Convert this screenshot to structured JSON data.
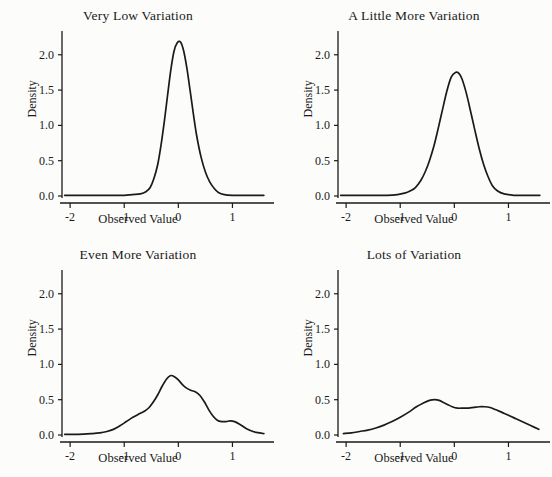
{
  "figure": {
    "background_color": "#fcfcfb",
    "line_color": "#1a1a1a",
    "axis_color": "#1a1a1a",
    "panel_rows": 2,
    "panel_cols": 2
  },
  "chart_data": [
    {
      "type": "line",
      "title": "Very Low Variation",
      "xlabel": "Observed Value",
      "ylabel": "Density",
      "xlim": [
        -2.15,
        1.62
      ],
      "ylim": [
        0.0,
        2.28
      ],
      "xticks": [
        -2,
        -1,
        0,
        1
      ],
      "xticklabels": [
        "-2",
        "-1",
        "0",
        "1"
      ],
      "yticks": [
        0.0,
        0.5,
        1.0,
        1.5,
        2.0
      ],
      "yticklabels": [
        "0.0",
        "0.5",
        "1.0",
        "1.5",
        "2.0"
      ],
      "grid": false,
      "legend": "none",
      "x": [
        -2.1,
        -1.8,
        -1.5,
        -1.2,
        -1.0,
        -0.85,
        -0.7,
        -0.6,
        -0.52,
        -0.45,
        -0.38,
        -0.32,
        -0.26,
        -0.2,
        -0.14,
        -0.08,
        -0.02,
        0.04,
        0.1,
        0.16,
        0.22,
        0.28,
        0.34,
        0.42,
        0.5,
        0.58,
        0.66,
        0.74,
        0.85,
        1.0,
        1.2,
        1.4,
        1.58
      ],
      "y": [
        0.01,
        0.01,
        0.01,
        0.01,
        0.01,
        0.02,
        0.03,
        0.06,
        0.12,
        0.25,
        0.45,
        0.72,
        1.05,
        1.42,
        1.78,
        2.05,
        2.17,
        2.18,
        2.05,
        1.8,
        1.48,
        1.15,
        0.85,
        0.55,
        0.34,
        0.2,
        0.11,
        0.05,
        0.02,
        0.01,
        0.01,
        0.01,
        0.01
      ]
    },
    {
      "type": "line",
      "title": "A Little More Variation",
      "xlabel": "Observed Value",
      "ylabel": "Density",
      "xlim": [
        -2.15,
        1.62
      ],
      "ylim": [
        0.0,
        2.28
      ],
      "xticks": [
        -2,
        -1,
        0,
        1
      ],
      "xticklabels": [
        "-2",
        "-1",
        "0",
        "1"
      ],
      "yticks": [
        0.0,
        0.5,
        1.0,
        1.5,
        2.0
      ],
      "yticklabels": [
        "0.0",
        "0.5",
        "1.0",
        "1.5",
        "2.0"
      ],
      "grid": false,
      "legend": "none",
      "x": [
        -2.1,
        -1.8,
        -1.5,
        -1.25,
        -1.05,
        -0.92,
        -0.82,
        -0.72,
        -0.62,
        -0.54,
        -0.46,
        -0.38,
        -0.3,
        -0.22,
        -0.14,
        -0.06,
        0.02,
        0.08,
        0.14,
        0.22,
        0.3,
        0.38,
        0.46,
        0.54,
        0.62,
        0.7,
        0.8,
        0.92,
        1.1,
        1.3,
        1.58
      ],
      "y": [
        0.01,
        0.01,
        0.01,
        0.01,
        0.02,
        0.04,
        0.07,
        0.12,
        0.22,
        0.34,
        0.5,
        0.7,
        0.95,
        1.22,
        1.48,
        1.68,
        1.75,
        1.74,
        1.66,
        1.46,
        1.2,
        0.93,
        0.67,
        0.45,
        0.28,
        0.15,
        0.07,
        0.03,
        0.01,
        0.01,
        0.01
      ]
    },
    {
      "type": "line",
      "title": "Even More Variation",
      "xlabel": "Observed Value",
      "ylabel": "Density",
      "xlim": [
        -2.15,
        1.62
      ],
      "ylim": [
        0.0,
        2.28
      ],
      "xticks": [
        -2,
        -1,
        0,
        1
      ],
      "xticklabels": [
        "-2",
        "-1",
        "0",
        "1"
      ],
      "yticks": [
        0.0,
        0.5,
        1.0,
        1.5,
        2.0
      ],
      "yticklabels": [
        "0.0",
        "0.5",
        "1.0",
        "1.5",
        "2.0"
      ],
      "grid": false,
      "legend": "none",
      "x": [
        -2.1,
        -1.85,
        -1.6,
        -1.45,
        -1.32,
        -1.2,
        -1.08,
        -0.96,
        -0.84,
        -0.72,
        -0.62,
        -0.54,
        -0.46,
        -0.38,
        -0.3,
        -0.22,
        -0.15,
        -0.08,
        0.0,
        0.08,
        0.16,
        0.24,
        0.32,
        0.4,
        0.48,
        0.56,
        0.64,
        0.72,
        0.8,
        0.88,
        0.96,
        1.04,
        1.14,
        1.26,
        1.38,
        1.5,
        1.58
      ],
      "y": [
        0.01,
        0.01,
        0.02,
        0.03,
        0.05,
        0.08,
        0.13,
        0.19,
        0.25,
        0.3,
        0.34,
        0.39,
        0.47,
        0.57,
        0.69,
        0.79,
        0.84,
        0.83,
        0.78,
        0.71,
        0.66,
        0.63,
        0.61,
        0.56,
        0.47,
        0.36,
        0.27,
        0.21,
        0.19,
        0.19,
        0.2,
        0.19,
        0.15,
        0.09,
        0.05,
        0.03,
        0.02
      ]
    },
    {
      "type": "line",
      "title": "Lots of Variation",
      "xlabel": "Observed Value",
      "ylabel": "Density",
      "xlim": [
        -2.15,
        1.62
      ],
      "ylim": [
        0.0,
        2.28
      ],
      "xticks": [
        -2,
        -1,
        0,
        1
      ],
      "xticklabels": [
        "-2",
        "-1",
        "0",
        "1"
      ],
      "yticks": [
        0.0,
        0.5,
        1.0,
        1.5,
        2.0
      ],
      "yticklabels": [
        "0.0",
        "0.5",
        "1.0",
        "1.5",
        "2.0"
      ],
      "grid": false,
      "legend": "none",
      "x": [
        -2.05,
        -1.9,
        -1.75,
        -1.6,
        -1.45,
        -1.3,
        -1.15,
        -1.0,
        -0.85,
        -0.7,
        -0.58,
        -0.46,
        -0.36,
        -0.28,
        -0.2,
        -0.12,
        -0.04,
        0.06,
        0.16,
        0.26,
        0.36,
        0.46,
        0.56,
        0.66,
        0.76,
        0.88,
        1.0,
        1.14,
        1.28,
        1.42,
        1.56
      ],
      "y": [
        0.02,
        0.03,
        0.05,
        0.07,
        0.1,
        0.14,
        0.19,
        0.25,
        0.32,
        0.4,
        0.45,
        0.49,
        0.5,
        0.49,
        0.46,
        0.43,
        0.4,
        0.38,
        0.38,
        0.38,
        0.39,
        0.4,
        0.4,
        0.39,
        0.36,
        0.32,
        0.28,
        0.23,
        0.18,
        0.13,
        0.08
      ]
    }
  ]
}
